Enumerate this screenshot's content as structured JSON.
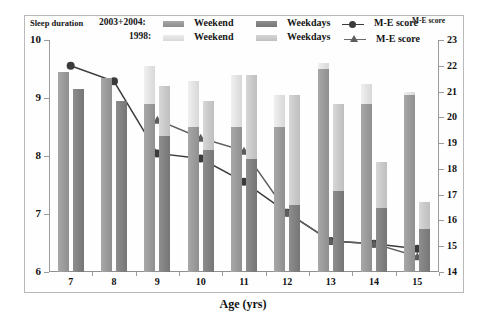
{
  "axis_titles": {
    "left": "Sleep duration",
    "right": "M-E score",
    "bottom": "Age (yrs)"
  },
  "legend": {
    "row1_group": "2003+2004:",
    "row2_group": "1998:",
    "weekend": "Weekend",
    "weekdays": "Weekdays",
    "me_score": "M-E score",
    "colors": {
      "weekend_2003": "#9a9a9a",
      "weekdays_2003": "#808080",
      "weekend_1998": "#e2e2e2",
      "weekdays_1998": "#c9c9c9",
      "line": "#3b3b3b"
    }
  },
  "chart_data": {
    "type": "bar",
    "title": "",
    "xlabel": "Age (yrs)",
    "ylabel": "Sleep duration",
    "y2label": "M-E score",
    "categories": [
      "7",
      "8",
      "9",
      "10",
      "11",
      "12",
      "13",
      "14",
      "15"
    ],
    "ylim": [
      6,
      10
    ],
    "ylim_right": [
      14,
      23
    ],
    "yticks": [
      "10",
      "9",
      "8",
      "7",
      "6"
    ],
    "yticks_right": [
      "23",
      "22",
      "21",
      "20",
      "19",
      "18",
      "17",
      "16",
      "15",
      "14"
    ],
    "grid": false,
    "legend_position": "top",
    "series": [
      {
        "name": "1998 Weekend",
        "axis": "left",
        "type": "bar",
        "color": "#e2e2e2",
        "values": [
          null,
          null,
          9.55,
          9.3,
          9.4,
          9.05,
          9.6,
          9.25,
          9.1
        ]
      },
      {
        "name": "2003+2004 Weekend",
        "axis": "left",
        "type": "bar",
        "color": "#9a9a9a",
        "values": [
          9.45,
          9.35,
          8.9,
          8.5,
          8.5,
          8.5,
          9.5,
          8.9,
          9.05
        ]
      },
      {
        "name": "2003+2004 Weekdays",
        "axis": "left",
        "type": "bar",
        "color": "#808080",
        "values": [
          9.15,
          8.95,
          8.35,
          8.1,
          7.95,
          7.15,
          7.4,
          7.1,
          6.75
        ]
      },
      {
        "name": "1998 Weekdays",
        "axis": "left",
        "type": "bar",
        "color": "#c9c9c9",
        "values": [
          null,
          null,
          9.2,
          8.95,
          9.4,
          9.05,
          8.9,
          7.9,
          7.2
        ]
      },
      {
        "name": "2003+2004 M-E score",
        "axis": "right",
        "type": "line",
        "marker": "circle",
        "color": "#3b3b3b",
        "values": [
          22.0,
          21.4,
          18.6,
          18.4,
          17.5,
          16.3,
          15.2,
          15.1,
          14.9
        ]
      },
      {
        "name": "1998 M-E score",
        "axis": "right",
        "type": "line",
        "marker": "triangle",
        "color": "#5d5d5d",
        "values": [
          null,
          null,
          19.9,
          19.2,
          18.7,
          16.3,
          15.2,
          15.1,
          14.6
        ]
      }
    ]
  }
}
